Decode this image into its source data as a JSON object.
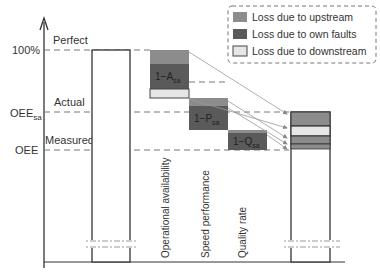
{
  "diagram": {
    "y_axis": {
      "levels": [
        {
          "id": "perfect",
          "tick_label": "100%",
          "region_label": "Perfect"
        },
        {
          "id": "oee_sa",
          "tick_label": "OEE",
          "tick_subscript": "sa",
          "region_label": "Actual"
        },
        {
          "id": "oee",
          "tick_label": "OEE",
          "tick_subscript": "",
          "region_label": "Measured"
        }
      ]
    },
    "loss_blocks": [
      {
        "label": "1−A",
        "subscript": "sa",
        "category": "Operational availability"
      },
      {
        "label": "1−P",
        "subscript": "sa",
        "category": "Speed performance"
      },
      {
        "label": "1−Q",
        "subscript": "sa",
        "category": "Quality rate"
      }
    ],
    "legend": [
      {
        "label": "Loss due to upstream",
        "color": "#8c8c8c"
      },
      {
        "label": "Loss due to own faults",
        "color": "#5a5a5a"
      },
      {
        "label": "Loss due to downstream",
        "color": "#e6e6e6"
      }
    ],
    "colors": {
      "upstream": "#8c8c8c",
      "own": "#5a5a5a",
      "downstream": "#e6e6e6",
      "line": "#333333",
      "dash": "#777777"
    }
  }
}
